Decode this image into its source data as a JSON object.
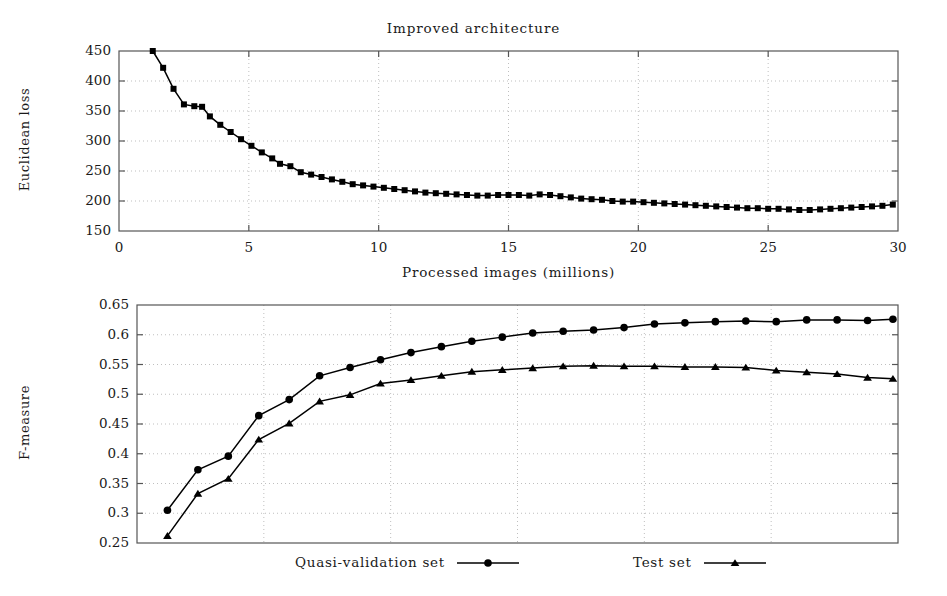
{
  "figure": {
    "title": "Improved architecture",
    "width": 947,
    "height": 596,
    "background": "#ffffff",
    "line_color": "#000000",
    "grid_color": "#bfbfbf",
    "frame_color": "#555555"
  },
  "legend": {
    "position": "bottom-center",
    "entries": [
      {
        "label": "Quasi-validation set",
        "marker": "circle"
      },
      {
        "label": "Test set",
        "marker": "triangle"
      }
    ]
  },
  "chart_data": [
    {
      "id": "loss-chart",
      "type": "line",
      "title": "Improved architecture",
      "xlabel": "Processed images (millions)",
      "ylabel": "Euclidean loss",
      "xlim": [
        0,
        30
      ],
      "ylim": [
        150,
        450
      ],
      "xticks": [
        0,
        5,
        10,
        15,
        20,
        25,
        30
      ],
      "yticks": [
        150,
        200,
        250,
        300,
        350,
        400,
        450
      ],
      "grid": true,
      "legend": "none",
      "marker": "square",
      "series": [
        {
          "name": "Euclidean loss",
          "x": [
            1.3,
            1.7,
            2.1,
            2.5,
            2.9,
            3.2,
            3.5,
            3.9,
            4.3,
            4.7,
            5.1,
            5.5,
            5.9,
            6.2,
            6.6,
            7.0,
            7.4,
            7.8,
            8.2,
            8.6,
            9.0,
            9.4,
            9.8,
            10.2,
            10.6,
            11.0,
            11.4,
            11.8,
            12.2,
            12.6,
            13.0,
            13.4,
            13.8,
            14.2,
            14.6,
            15.0,
            15.4,
            15.8,
            16.2,
            16.6,
            17.0,
            17.4,
            17.8,
            18.2,
            18.6,
            19.0,
            19.4,
            19.8,
            20.2,
            20.6,
            21.0,
            21.4,
            21.8,
            22.2,
            22.6,
            23.0,
            23.4,
            23.8,
            24.2,
            24.6,
            25.0,
            25.4,
            25.8,
            26.2,
            26.6,
            27.0,
            27.4,
            27.8,
            28.2,
            28.6,
            29.0,
            29.4,
            29.8
          ],
          "y": [
            450,
            422,
            387,
            361,
            358,
            357,
            341,
            327,
            315,
            303,
            292,
            281,
            271,
            262,
            258,
            248,
            244,
            240,
            236,
            232,
            228,
            226,
            224,
            222,
            220,
            218,
            216,
            214,
            213,
            212,
            211,
            210,
            209,
            209,
            210,
            210,
            210,
            209,
            211,
            210,
            208,
            206,
            204,
            203,
            202,
            200,
            199,
            199,
            198,
            197,
            196,
            195,
            194,
            193,
            192,
            191,
            190,
            189,
            188,
            188,
            187,
            187,
            186,
            185,
            185,
            186,
            187,
            188,
            189,
            190,
            191,
            192,
            194
          ]
        }
      ]
    },
    {
      "id": "fmeasure-chart",
      "type": "line",
      "title": "",
      "xlabel": "",
      "ylabel": "F-measure",
      "xlim": [
        0,
        30
      ],
      "ylim": [
        0.25,
        0.65
      ],
      "xticks": [
        0,
        5,
        10,
        15,
        20,
        25,
        30
      ],
      "yticks": [
        0.25,
        0.3,
        0.35,
        0.4,
        0.45,
        0.5,
        0.55,
        0.6,
        0.65
      ],
      "ytick_labels": [
        "0.25",
        "0.3",
        "0.35",
        "0.4",
        "0.45",
        "0.5",
        "0.55",
        "0.6",
        "0.65"
      ],
      "grid": true,
      "legend": "bottom",
      "series": [
        {
          "name": "Quasi-validation set",
          "marker": "circle",
          "x": [
            1.2,
            2.4,
            3.6,
            4.8,
            6.0,
            7.2,
            8.4,
            9.6,
            10.8,
            12.0,
            13.2,
            14.4,
            15.6,
            16.8,
            18.0,
            19.2,
            20.4,
            21.6,
            22.8,
            24.0,
            25.2,
            26.4,
            27.6,
            28.8,
            29.8
          ],
          "y": [
            0.305,
            0.373,
            0.396,
            0.464,
            0.491,
            0.531,
            0.545,
            0.558,
            0.57,
            0.58,
            0.589,
            0.596,
            0.603,
            0.606,
            0.608,
            0.612,
            0.618,
            0.62,
            0.622,
            0.623,
            0.622,
            0.625,
            0.625,
            0.624,
            0.626
          ]
        },
        {
          "name": "Test set",
          "marker": "triangle",
          "x": [
            1.2,
            2.4,
            3.6,
            4.8,
            6.0,
            7.2,
            8.4,
            9.6,
            10.8,
            12.0,
            13.2,
            14.4,
            15.6,
            16.8,
            18.0,
            19.2,
            20.4,
            21.6,
            22.8,
            24.0,
            25.2,
            26.4,
            27.6,
            28.8,
            29.8
          ],
          "y": [
            0.262,
            0.333,
            0.358,
            0.424,
            0.451,
            0.488,
            0.499,
            0.518,
            0.524,
            0.531,
            0.538,
            0.541,
            0.544,
            0.547,
            0.548,
            0.547,
            0.547,
            0.546,
            0.546,
            0.545,
            0.54,
            0.537,
            0.534,
            0.528,
            0.526
          ]
        }
      ]
    }
  ]
}
